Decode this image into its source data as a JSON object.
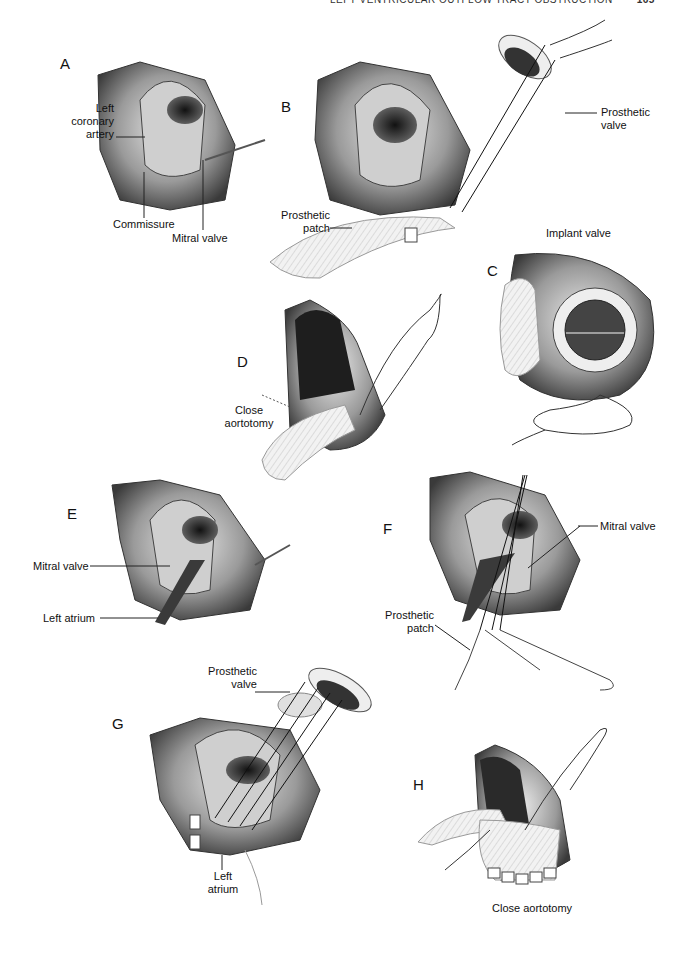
{
  "header": {
    "running_title": "LEFT VENTRICULAR OUTFLOW TRACT OBSTRUCTION",
    "page_number": "165"
  },
  "panels": {
    "A": {
      "letter": "A",
      "labels": {
        "left_coronary_artery": "Left\ncoronary\nartery",
        "commissure": "Commissure",
        "mitral_valve": "Mitral valve"
      }
    },
    "B": {
      "letter": "B",
      "labels": {
        "prosthetic_valve": "Prosthetic\nvalve",
        "prosthetic_patch": "Prosthetic\npatch"
      }
    },
    "C": {
      "letter": "C",
      "labels": {
        "caption": "Implant valve"
      }
    },
    "D": {
      "letter": "D",
      "labels": {
        "caption": "Close\naortotomy"
      }
    },
    "E": {
      "letter": "E",
      "labels": {
        "mitral_valve": "Mitral valve",
        "left_atrium": "Left atrium"
      }
    },
    "F": {
      "letter": "F",
      "labels": {
        "mitral_valve": "Mitral valve",
        "prosthetic_patch": "Prosthetic\npatch"
      }
    },
    "G": {
      "letter": "G",
      "labels": {
        "prosthetic_valve": "Prosthetic\nvalve",
        "left_atrium": "Left\natrium"
      }
    },
    "H": {
      "letter": "H",
      "labels": {
        "caption": "Close aortotomy"
      }
    }
  }
}
